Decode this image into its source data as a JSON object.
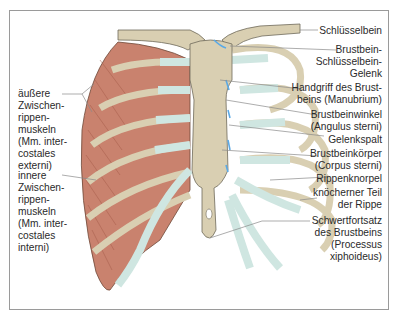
{
  "figure": {
    "colors": {
      "bone": "#d9cfb2",
      "cartilage": "#cfe6e1",
      "muscle": "#c9826e",
      "joint": "#5aa9e6",
      "leader_line": "#8a8a8a",
      "frame": "#9a9a9a"
    }
  },
  "labels_left": [
    {
      "id": "external-intercostals",
      "text": "äußere\nZwischen-\nrippen-\nmuskeln\n(Mm. inter-\ncostales\nexterni)"
    },
    {
      "id": "internal-intercostals",
      "text": "innere\nZwischen-\nrippen-\nmuskeln\n(Mm. inter-\ncostales\ninterni)"
    }
  ],
  "labels_right": [
    {
      "id": "clavicle",
      "text": "Schlüsselbein"
    },
    {
      "id": "sternoclavicular-joint",
      "text": "Brustbein-\nSchlüsselbein-\nGelenk"
    },
    {
      "id": "manubrium",
      "text": "Handgriff des Brust-\nbeins (Manubrium)"
    },
    {
      "id": "sternal-angle",
      "text": "Brustbeinwinkel\n(Angulus sterni)"
    },
    {
      "id": "joint-space",
      "text": "Gelenkspalt"
    },
    {
      "id": "sternal-body",
      "text": "Brustbeinkörper\n(Corpus sterni)"
    },
    {
      "id": "costal-cartilage",
      "text": "Rippenknorpel"
    },
    {
      "id": "bony-rib",
      "text": "knöcherner Teil\nder Rippe"
    },
    {
      "id": "xiphoid-process",
      "text": "Schwertfortsatz\ndes Brustbeins\n(Processus\nxiphoideus)"
    }
  ]
}
